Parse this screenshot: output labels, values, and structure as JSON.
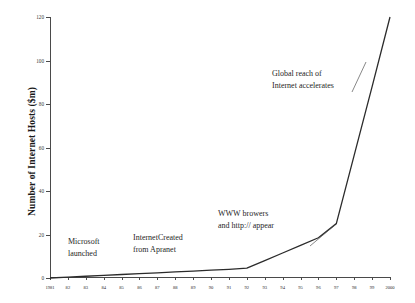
{
  "chart_data": {
    "type": "line",
    "title": "",
    "xlabel": "",
    "ylabel": "Number of Internet Hosts ($m)",
    "xlim": [
      1981,
      2000
    ],
    "ylim": [
      0,
      120
    ],
    "grid": false,
    "legend": false,
    "y_ticks": [
      0,
      20,
      40,
      60,
      80,
      100,
      120
    ],
    "y_tick_labels": [
      "0",
      "20",
      "40",
      "60",
      "80",
      "100",
      "120"
    ],
    "x": [
      1981,
      1982,
      1983,
      1984,
      1985,
      1986,
      1987,
      1988,
      1989,
      1990,
      1991,
      1992,
      1993,
      1994,
      1995,
      1996,
      1997,
      1998,
      1999,
      2000
    ],
    "x_tick_labels": [
      "1981",
      "82",
      "83",
      "84",
      "85",
      "86",
      "87",
      "88",
      "89",
      "90",
      "91",
      "92",
      "93",
      "94",
      "95",
      "96",
      "97",
      "98",
      "99",
      "2000"
    ],
    "series": [
      {
        "name": "Number of Internet Hosts ($m)",
        "color": "#2b2b2b",
        "values": [
          0,
          0.4,
          0.8,
          1.2,
          1.6,
          2.0,
          2.4,
          2.8,
          3.2,
          3.6,
          4.0,
          4.5,
          8.0,
          11.5,
          15.0,
          18.5,
          25.0,
          56.5,
          88.0,
          120.0
        ]
      }
    ],
    "annotations": [
      {
        "text": "Microsoft\nlaunched",
        "x": 1982,
        "y": 23
      },
      {
        "text": "InternetCreated\nfrom Apranet",
        "x": 1986,
        "y": 25
      },
      {
        "text": "WWW browers\nand http:// appear",
        "x": 1991,
        "y": 36
      },
      {
        "text": "Global reach of\nInternet accelerates",
        "x": 1994,
        "y": 100
      }
    ]
  },
  "axes": {
    "y_title": "Number of Internet Hosts ($m)"
  }
}
